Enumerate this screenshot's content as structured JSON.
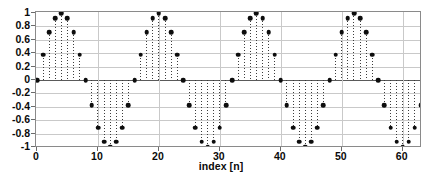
{
  "chart_data": {
    "type": "scatter",
    "plot_style": "stem",
    "title": "",
    "xlabel": "index [n]",
    "ylabel": "",
    "grid": true,
    "legend": null,
    "xlim": [
      0,
      63
    ],
    "ylim": [
      -1,
      1
    ],
    "xticks": [
      0,
      10,
      20,
      30,
      40,
      50,
      60
    ],
    "xtick_labels": [
      "0",
      "10",
      "20",
      "30",
      "40",
      "50",
      "60"
    ],
    "yticks": [
      1,
      0.8,
      0.6,
      0.4,
      0.2,
      0,
      -0.2,
      -0.4,
      -0.6,
      -0.8,
      -1
    ],
    "ytick_labels": [
      "1",
      "0.8",
      "0.6",
      "0.4",
      "0.2",
      "0",
      "-0.2",
      "-0.4",
      "-0.6",
      "-0.8",
      "-1"
    ],
    "period": 16,
    "amplitude": 1,
    "x": [
      0,
      1,
      2,
      3,
      4,
      5,
      6,
      7,
      8,
      9,
      10,
      11,
      12,
      13,
      14,
      15,
      16,
      17,
      18,
      19,
      20,
      21,
      22,
      23,
      24,
      25,
      26,
      27,
      28,
      29,
      30,
      31,
      32,
      33,
      34,
      35,
      36,
      37,
      38,
      39,
      40,
      41,
      42,
      43,
      44,
      45,
      46,
      47,
      48,
      49,
      50,
      51,
      52,
      53,
      54,
      55,
      56,
      57,
      58,
      59,
      60,
      61,
      62,
      63
    ],
    "values": [
      0,
      0.38,
      0.71,
      0.92,
      1,
      0.92,
      0.71,
      0.38,
      0,
      -0.38,
      -0.71,
      -0.92,
      -1,
      -0.92,
      -0.71,
      -0.38,
      0,
      0.38,
      0.71,
      0.92,
      1,
      0.92,
      0.71,
      0.38,
      0,
      -0.38,
      -0.71,
      -0.92,
      -1,
      -0.92,
      -0.71,
      -0.38,
      0,
      0.38,
      0.71,
      0.92,
      1,
      0.92,
      0.71,
      0.38,
      0,
      -0.38,
      -0.71,
      -0.92,
      -1,
      -0.92,
      -0.71,
      -0.38,
      0,
      0.38,
      0.71,
      0.92,
      1,
      0.92,
      0.71,
      0.38,
      0,
      -0.38,
      -0.71,
      -0.92,
      -1,
      -0.92,
      -0.71,
      -0.38
    ],
    "marker_color": "#0d0d0d",
    "stem_color": "#3c3c3c",
    "grid_color": "#c9c9c9",
    "axis_color": "#8a8a8a"
  }
}
